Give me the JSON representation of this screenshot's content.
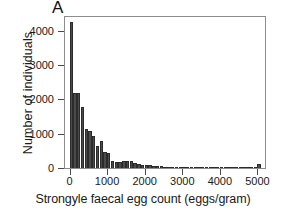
{
  "panel": {
    "letter": "A"
  },
  "chart_data": {
    "type": "bar",
    "title": "",
    "subtitle": "",
    "xlabel": "Strongyle faecal egg count (eggs/gram)",
    "ylabel": "Number of individuals",
    "grid": false,
    "legend": null,
    "xlim": [
      -120,
      5200
    ],
    "ylim": [
      0,
      4400
    ],
    "xticks": [
      0,
      1000,
      2000,
      3000,
      4000,
      5000
    ],
    "xtick_labels": [
      "0",
      "1000",
      "2000",
      "3000",
      "4000",
      "5000"
    ],
    "yticks": [
      0,
      1000,
      2000,
      3000,
      4000
    ],
    "ytick_labels": [
      "0",
      "1000",
      "2000",
      "3000",
      "4000"
    ],
    "bin_width": 100,
    "bar_color": "#4b4b4b",
    "bar_edge_color": "#2b2b2b",
    "x": [
      0,
      100,
      200,
      300,
      400,
      500,
      600,
      700,
      800,
      900,
      1000,
      1100,
      1200,
      1300,
      1400,
      1500,
      1600,
      1700,
      1800,
      1900,
      2000,
      2100,
      2200,
      2300,
      2400,
      2500,
      2600,
      2700,
      2800,
      2900,
      3000,
      3100,
      3200,
      3300,
      3400,
      3500,
      3600,
      3700,
      3800,
      3900,
      4000,
      4100,
      4200,
      4300,
      4400,
      4500,
      4600,
      4700,
      4800,
      4900,
      5000
    ],
    "values": [
      4250,
      2200,
      2180,
      1780,
      1130,
      1090,
      930,
      650,
      790,
      470,
      430,
      200,
      180,
      170,
      210,
      190,
      200,
      150,
      120,
      80,
      100,
      90,
      70,
      50,
      60,
      35,
      30,
      40,
      25,
      30,
      20,
      25,
      15,
      20,
      15,
      12,
      15,
      10,
      12,
      10,
      10,
      8,
      8,
      6,
      8,
      6,
      5,
      5,
      5,
      5,
      120
    ]
  }
}
